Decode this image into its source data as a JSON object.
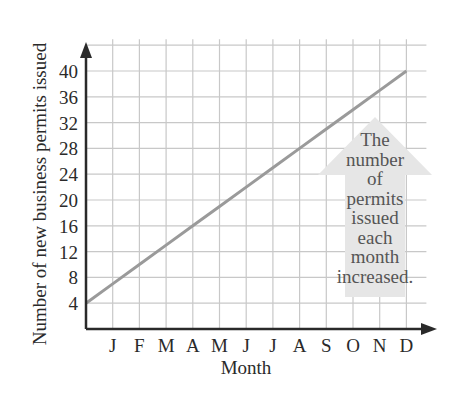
{
  "chart_data": {
    "type": "line",
    "title": "",
    "xlabel": "Month",
    "ylabel": "Number of new business permits issued",
    "categories": [
      "J",
      "F",
      "M",
      "A",
      "M",
      "J",
      "J",
      "A",
      "S",
      "O",
      "N",
      "D"
    ],
    "x_tick_labels": [
      "J",
      "F",
      "M",
      "A",
      "M",
      "J",
      "J",
      "A",
      "S",
      "O",
      "N",
      "D"
    ],
    "y_tick_labels": [
      "4",
      "8",
      "12",
      "16",
      "20",
      "24",
      "28",
      "32",
      "36",
      "40"
    ],
    "series": [
      {
        "name": "Permits issued",
        "values": [
          7,
          10,
          13,
          16,
          19,
          22,
          25,
          28,
          31,
          34,
          37,
          40
        ],
        "start_value_at_origin": 4
      }
    ],
    "ylim": [
      0,
      44
    ],
    "grid": true,
    "legend": "none",
    "annotation": {
      "type": "up-arrow",
      "lines": [
        "The",
        "number",
        "of",
        "permits",
        "issued",
        "each",
        "month",
        "increased."
      ]
    },
    "colors": {
      "line": "#9a9a9a",
      "grid": "#c8c8c8",
      "axis": "#2a2a2a",
      "arrow": "#e6e6e6",
      "annotation_text": "#555555"
    }
  }
}
